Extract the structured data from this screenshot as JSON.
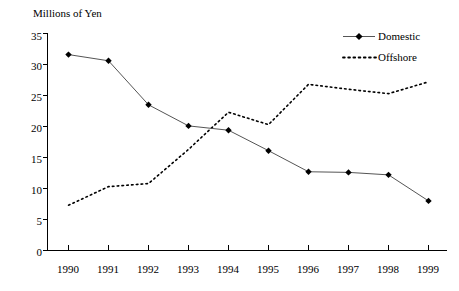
{
  "chart_data": {
    "type": "line",
    "title": "",
    "subtitle": "",
    "xlabel": "",
    "ylabel": "Millions of Yen",
    "categories": [
      "1990",
      "1991",
      "1992",
      "1993",
      "1994",
      "1995",
      "1996",
      "1997",
      "1998",
      "1999"
    ],
    "series": [
      {
        "name": "Domestic",
        "style": "solid-with-diamond-markers",
        "color": "#000000",
        "values": [
          31.6,
          30.6,
          23.5,
          20.1,
          19.4,
          16.1,
          12.7,
          12.6,
          12.2,
          8.0
        ]
      },
      {
        "name": "Offshore",
        "style": "dotted",
        "color": "#000000",
        "values": [
          7.3,
          10.3,
          10.8,
          16.3,
          22.3,
          20.3,
          26.8,
          26.0,
          25.3,
          27.2
        ]
      }
    ],
    "ylim": [
      0,
      35
    ],
    "yticks": [
      0,
      5,
      10,
      15,
      20,
      25,
      30,
      35
    ],
    "ytick_labels": [
      "0",
      "5",
      "10",
      "15",
      "20",
      "25",
      "30",
      "35"
    ],
    "grid": false,
    "legend_position": "top-right",
    "legend": [
      {
        "label": "Domestic",
        "marker": "diamond",
        "line": "solid"
      },
      {
        "label": "Offshore",
        "marker": "none",
        "line": "dotted"
      }
    ]
  }
}
